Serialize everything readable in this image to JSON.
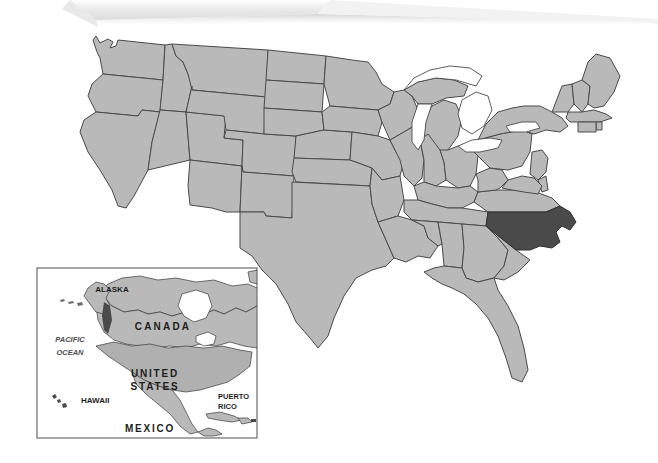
{
  "document": {
    "title": "United States Map",
    "background_color": "#ffffff",
    "width": 658,
    "height": 463
  },
  "map": {
    "name": "united-states-reference-map",
    "type": "choropleth-locator",
    "projection_note": "conic, curved northern border",
    "colors": {
      "state_fill": "#b9b9b9",
      "highlight_fill": "#4a4a4a",
      "border_stroke": "#4a4a4a",
      "water_fill": "#ffffff",
      "background": "#ffffff",
      "inset_border": "#6b6b6b"
    },
    "highlighted_state": {
      "name": "North Carolina",
      "abbreviation": "NC",
      "fill": "#4a4a4a"
    },
    "water_features": [
      "Lake Superior",
      "Lake Michigan",
      "Lake Huron",
      "Lake Erie",
      "Lake Ontario",
      "Atlantic Ocean",
      "Gulf of Mexico",
      "Pacific Ocean"
    ]
  },
  "inset": {
    "name": "north-america-locator-inset",
    "border_color": "#6b6b6b",
    "labels": [
      {
        "id": "alaska",
        "text": "ALASKA",
        "x": 112,
        "y": 292,
        "size": 8,
        "style": "bold"
      },
      {
        "id": "canada",
        "text": "CANADA",
        "x": 163,
        "y": 330,
        "size": 10,
        "style": "bold",
        "letter_spacing": 2.2
      },
      {
        "id": "pacific",
        "text": "PACIFIC",
        "x": 70,
        "y": 342,
        "size": 7.5,
        "style": "italic"
      },
      {
        "id": "ocean",
        "text": "OCEAN",
        "x": 70,
        "y": 355,
        "size": 7.5,
        "style": "italic"
      },
      {
        "id": "united",
        "text": "UNITED",
        "x": 155,
        "y": 377,
        "size": 10,
        "style": "bold",
        "letter_spacing": 1.8
      },
      {
        "id": "states",
        "text": "STATES",
        "x": 155,
        "y": 390,
        "size": 10,
        "style": "bold",
        "letter_spacing": 1.8
      },
      {
        "id": "hawaii",
        "text": "HAWAII",
        "x": 81,
        "y": 403,
        "size": 8,
        "style": "bold"
      },
      {
        "id": "puerto",
        "text": "PUERTO",
        "x": 232,
        "y": 399,
        "size": 7.5,
        "style": "bold"
      },
      {
        "id": "rico",
        "text": "RICO",
        "x": 232,
        "y": 409,
        "size": 7.5,
        "style": "bold"
      },
      {
        "id": "mexico",
        "text": "MEXICO",
        "x": 150,
        "y": 432,
        "size": 10,
        "style": "bold",
        "letter_spacing": 1.8
      }
    ]
  },
  "artifact": {
    "name": "scanned-page-curl",
    "description": "light gray torn paper edge with soft shadow across top of scan",
    "color": "#e6e6e6",
    "shadow_color": "#d2d2d2"
  }
}
